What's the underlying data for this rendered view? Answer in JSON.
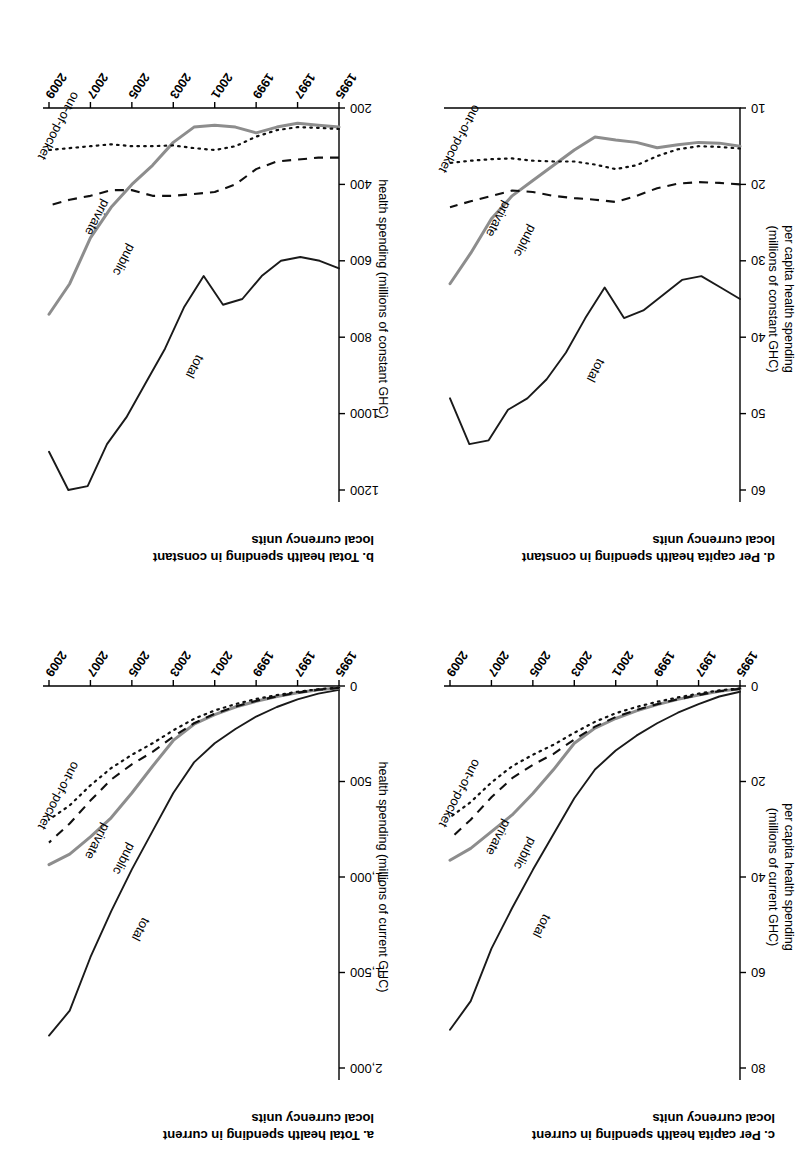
{
  "figure": {
    "orientation_note": "rotated-180",
    "series_names": [
      "total",
      "public",
      "private",
      "out-of-pocket"
    ],
    "colors": {
      "total": "#1a1a1a",
      "public": "#8d8d8d",
      "private": "#101010",
      "out_of_pocket": "#101010",
      "background": "#ffffff"
    },
    "x_tick_labels": [
      "1995",
      "1997",
      "1999",
      "2001",
      "2003",
      "2005",
      "2007",
      "2009"
    ]
  },
  "panels": {
    "a": {
      "label": "a.",
      "title": "a. Total health spending in current\nlocal currency units",
      "axis_title": "health spending (millions of current GHC)",
      "series_labels": {
        "total": "total",
        "public": "public",
        "private": "private",
        "oop": "out-of-pocket"
      }
    },
    "b": {
      "label": "b.",
      "title": "b. Total health spending in constant\nlocal currency units",
      "axis_title": "health spending (millions of constant GHC)",
      "series_labels": {
        "total": "total",
        "public": "public",
        "private": "private",
        "oop": "out-of-pocket"
      }
    },
    "c": {
      "label": "c.",
      "title": "c. Per capita health spending in current\nlocal currency units",
      "axis_title_line1": "per capita health spending",
      "axis_title_line2": "(millions of current GHC)",
      "series_labels": {
        "total": "total",
        "public": "public",
        "private": "private",
        "oop": "out-of-pocket"
      }
    },
    "d": {
      "label": "d.",
      "title": "d. Per capita health spending in constant\nlocal currency units",
      "axis_title_line1": "per capita health spending",
      "axis_title_line2": "(millions of constant GHC)",
      "series_labels": {
        "total": "total",
        "public": "public",
        "private": "private",
        "oop": "out-of-pocket"
      }
    }
  },
  "chart_data": [
    {
      "id": "a",
      "type": "line",
      "title": "a. Total health spending in current local currency units",
      "xlabel": "",
      "ylabel": "health spending (millions of current GHC)",
      "x": [
        1995,
        1996,
        1997,
        1998,
        1999,
        2000,
        2001,
        2002,
        2003,
        2004,
        2005,
        2006,
        2007,
        2008,
        2009
      ],
      "xlim": [
        1995,
        2009
      ],
      "ylim": [
        0,
        2000
      ],
      "yticks": [
        0,
        500,
        1000,
        1500,
        2000
      ],
      "ytick_labels": [
        "0",
        "500",
        "1,000",
        "1,500",
        "2,000"
      ],
      "xticks": [
        1995,
        1997,
        1999,
        2001,
        2003,
        2005,
        2007,
        2009
      ],
      "grid": false,
      "legend": "inline-annotations",
      "series": [
        {
          "name": "total",
          "style": "solid",
          "color": "#1a1a1a",
          "values": [
            20,
            40,
            70,
            110,
            160,
            225,
            300,
            400,
            560,
            760,
            960,
            1180,
            1420,
            1700,
            1830
          ]
        },
        {
          "name": "public",
          "style": "solid",
          "color": "#8d8d8d",
          "values": [
            10,
            20,
            35,
            55,
            80,
            110,
            150,
            200,
            285,
            420,
            560,
            690,
            790,
            880,
            935
          ]
        },
        {
          "name": "private",
          "style": "dashed",
          "color": "#101010",
          "values": [
            10,
            20,
            35,
            55,
            78,
            108,
            145,
            195,
            265,
            345,
            410,
            490,
            600,
            720,
            820
          ]
        },
        {
          "name": "out-of-pocket",
          "style": "dotted",
          "color": "#101010",
          "values": [
            8,
            17,
            30,
            48,
            68,
            95,
            128,
            172,
            232,
            300,
            360,
            430,
            520,
            625,
            700
          ]
        }
      ]
    },
    {
      "id": "b",
      "type": "line",
      "title": "b. Total health spending in constant local currency units",
      "xlabel": "",
      "ylabel": "health spending (millions of constant GHC)",
      "x": [
        1995,
        1996,
        1997,
        1998,
        1999,
        2000,
        2001,
        2002,
        2003,
        2004,
        2005,
        2006,
        2007,
        2008,
        2009
      ],
      "xlim": [
        1995,
        2009
      ],
      "ylim": [
        200,
        1200
      ],
      "yticks": [
        200,
        400,
        600,
        800,
        1000,
        1200
      ],
      "ytick_labels": [
        "200",
        "400",
        "600",
        "800",
        "1000",
        "1200"
      ],
      "xticks": [
        1995,
        1997,
        1999,
        2001,
        2003,
        2005,
        2007,
        2009
      ],
      "grid": false,
      "legend": "inline-annotations",
      "series": [
        {
          "name": "total",
          "style": "solid",
          "color": "#1a1a1a",
          "values": [
            620,
            600,
            590,
            600,
            640,
            700,
            715,
            640,
            720,
            830,
            920,
            1010,
            1080,
            1190,
            1200,
            1100
          ]
        },
        {
          "name": "public",
          "style": "solid",
          "color": "#8d8d8d",
          "values": [
            250,
            245,
            240,
            250,
            265,
            250,
            245,
            250,
            290,
            350,
            400,
            460,
            540,
            660,
            740
          ]
        },
        {
          "name": "private",
          "style": "dashed",
          "color": "#101010",
          "values": [
            330,
            330,
            335,
            340,
            360,
            400,
            420,
            425,
            430,
            430,
            415,
            415,
            430,
            440,
            455
          ]
        },
        {
          "name": "out-of-pocket",
          "style": "dotted",
          "color": "#101010",
          "values": [
            255,
            252,
            250,
            258,
            275,
            300,
            310,
            305,
            298,
            300,
            300,
            295,
            300,
            305,
            310
          ]
        }
      ]
    },
    {
      "id": "c",
      "type": "line",
      "title": "c. Per capita health spending in current local currency units",
      "xlabel": "",
      "ylabel": "per capita health spending (millions of current GHC)",
      "x": [
        1995,
        1996,
        1997,
        1998,
        1999,
        2000,
        2001,
        2002,
        2003,
        2004,
        2005,
        2006,
        2007,
        2008,
        2009
      ],
      "xlim": [
        1995,
        2009
      ],
      "ylim": [
        0,
        80
      ],
      "yticks": [
        0,
        20,
        40,
        60,
        80
      ],
      "ytick_labels": [
        "0",
        "20",
        "40",
        "60",
        "80"
      ],
      "xticks": [
        1995,
        1997,
        1999,
        2001,
        2003,
        2005,
        2007,
        2009
      ],
      "grid": false,
      "legend": "inline-annotations",
      "series": [
        {
          "name": "total",
          "style": "solid",
          "color": "#1a1a1a",
          "values": [
            1.2,
            2.2,
            3.8,
            5.6,
            7.8,
            10.4,
            13.5,
            17.5,
            23.5,
            31.0,
            38.5,
            46.5,
            55.0,
            66.0,
            72.0
          ]
        },
        {
          "name": "public",
          "style": "solid",
          "color": "#8d8d8d",
          "values": [
            0.6,
            1.1,
            1.9,
            2.8,
            3.9,
            5.2,
            6.8,
            8.8,
            12.0,
            17.5,
            22.5,
            27.0,
            30.5,
            34.0,
            36.5
          ]
        },
        {
          "name": "private",
          "style": "dashed",
          "color": "#101010",
          "values": [
            0.6,
            1.1,
            1.9,
            2.8,
            3.8,
            5.0,
            6.5,
            8.5,
            11.2,
            14.2,
            16.5,
            19.3,
            23.3,
            28.0,
            32.0
          ]
        },
        {
          "name": "out-of-pocket",
          "style": "dotted",
          "color": "#101010",
          "values": [
            0.5,
            0.9,
            1.6,
            2.4,
            3.3,
            4.4,
            5.7,
            7.5,
            9.8,
            12.3,
            14.4,
            16.8,
            20.2,
            24.3,
            27.5
          ]
        }
      ]
    },
    {
      "id": "d",
      "type": "line",
      "title": "d. Per capita health spending in constant local currency units",
      "xlabel": "",
      "ylabel": "per capita health spending (millions of constant GHC)",
      "x": [
        1995,
        1996,
        1997,
        1998,
        1999,
        2000,
        2001,
        2002,
        2003,
        2004,
        2005,
        2006,
        2007,
        2008,
        2009
      ],
      "xlim": [
        10,
        60
      ],
      "ylim": [
        10,
        60
      ],
      "yticks": [
        10,
        20,
        30,
        40,
        50,
        60
      ],
      "ytick_labels": [
        "10",
        "20",
        "30",
        "40",
        "50",
        "60"
      ],
      "xticks": [
        1995,
        1997,
        1999,
        2001,
        2003,
        2005,
        2007,
        2009
      ],
      "grid": false,
      "legend": "inline-annotations",
      "series": [
        {
          "name": "total",
          "style": "solid",
          "color": "#1a1a1a",
          "values": [
            35.0,
            33.5,
            32.0,
            32.5,
            34.5,
            36.5,
            37.5,
            33.5,
            37.5,
            42.0,
            45.5,
            48.0,
            49.5,
            53.5,
            54.0,
            48.0
          ]
        },
        {
          "name": "public",
          "style": "solid",
          "color": "#8d8d8d",
          "values": [
            15.0,
            14.6,
            14.5,
            14.8,
            15.2,
            14.5,
            14.2,
            13.8,
            15.5,
            17.5,
            19.5,
            21.5,
            24.5,
            29.0,
            33.0
          ]
        },
        {
          "name": "private",
          "style": "dashed",
          "color": "#101010",
          "values": [
            20.0,
            19.8,
            19.7,
            19.9,
            20.5,
            21.5,
            22.3,
            22.0,
            21.8,
            21.5,
            21.0,
            20.8,
            21.5,
            22.2,
            23.0
          ]
        },
        {
          "name": "out-of-pocket",
          "style": "dotted",
          "color": "#101010",
          "values": [
            15.3,
            15.1,
            15.0,
            15.4,
            16.3,
            17.5,
            18.0,
            17.4,
            17.0,
            17.0,
            16.9,
            16.6,
            16.7,
            16.9,
            17.2
          ]
        }
      ]
    }
  ]
}
